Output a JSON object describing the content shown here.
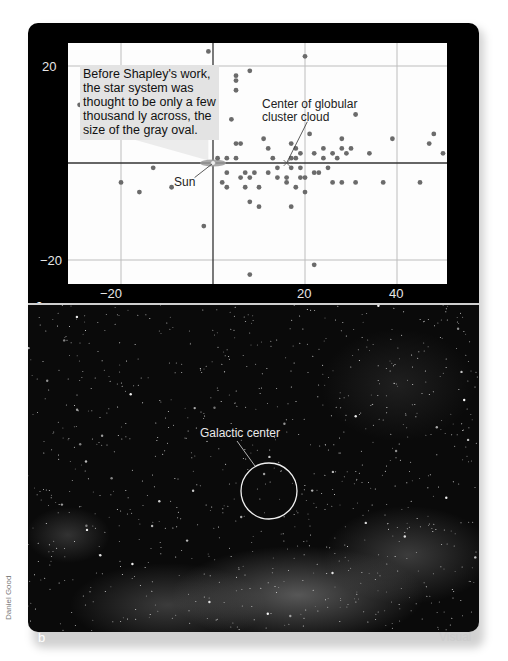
{
  "panel_a": {
    "label": "a",
    "callout_text": "Before Shapley's work, the star system was thought to be only a few thousand ly across, the size of the gray oval.",
    "center_label_line1": "Center of globular",
    "center_label_line2": "cluster cloud",
    "sun_label": "Sun",
    "y_ticks": [
      "20",
      "−20"
    ],
    "x_ticks": [
      "−20",
      "20",
      "40"
    ]
  },
  "panel_b": {
    "label": "b",
    "galactic_center_label": "Galactic center",
    "band_label": "Visual",
    "credit": "Daniel Good"
  },
  "chart_data": {
    "type": "scatter",
    "title": "",
    "xlabel": "",
    "ylabel": "",
    "xlim": [
      -31,
      51
    ],
    "ylim": [
      -25,
      25
    ],
    "x_ticks": [
      -20,
      20,
      40
    ],
    "y_ticks": [
      20,
      -20
    ],
    "grid": true,
    "gridlines_x": [
      -20,
      20,
      40
    ],
    "gridlines_y": [
      20,
      -20
    ],
    "axes_through_origin": true,
    "annotations": [
      {
        "text": "Sun",
        "x": 0,
        "y": 0
      },
      {
        "text": "Center of globular cluster cloud",
        "x": 16,
        "y": 0
      },
      {
        "text": "Before Shapley's work, the star system was thought to be only a few thousand ly across, the size of the gray oval.",
        "x": -20,
        "y": 20
      }
    ],
    "series": [
      {
        "name": "Globular clusters",
        "points": [
          [
            -29,
            12
          ],
          [
            -20,
            -4
          ],
          [
            -16,
            -6
          ],
          [
            -13,
            -1
          ],
          [
            -9,
            -5
          ],
          [
            -2,
            -13
          ],
          [
            -1,
            23
          ],
          [
            1,
            1
          ],
          [
            3,
            1
          ],
          [
            4,
            9
          ],
          [
            5,
            4
          ],
          [
            5,
            1
          ],
          [
            5,
            15
          ],
          [
            5,
            18
          ],
          [
            5,
            17
          ],
          [
            6,
            4
          ],
          [
            6,
            -3
          ],
          [
            7,
            -5
          ],
          [
            8,
            -3
          ],
          [
            8,
            -8
          ],
          [
            8,
            19
          ],
          [
            8,
            -23
          ],
          [
            2,
            -4
          ],
          [
            3,
            -2
          ],
          [
            3,
            -5
          ],
          [
            7,
            -2
          ],
          [
            9,
            -2
          ],
          [
            10,
            -5
          ],
          [
            10,
            -9
          ],
          [
            11,
            5
          ],
          [
            12,
            3
          ],
          [
            12,
            -2
          ],
          [
            13,
            1
          ],
          [
            14,
            -1
          ],
          [
            14,
            -3
          ],
          [
            16,
            -3
          ],
          [
            16,
            -4
          ],
          [
            17,
            1
          ],
          [
            17,
            4
          ],
          [
            17,
            -1
          ],
          [
            17,
            -9
          ],
          [
            18,
            1
          ],
          [
            18,
            3
          ],
          [
            18,
            -5
          ],
          [
            19,
            2
          ],
          [
            19,
            -1
          ],
          [
            19,
            -3
          ],
          [
            20,
            -3
          ],
          [
            20,
            -6
          ],
          [
            20,
            22
          ],
          [
            21,
            6
          ],
          [
            22,
            2
          ],
          [
            22,
            -2
          ],
          [
            22,
            -21
          ],
          [
            23,
            -2
          ],
          [
            24,
            1
          ],
          [
            24,
            3
          ],
          [
            25,
            -1
          ],
          [
            26,
            2
          ],
          [
            26,
            -4
          ],
          [
            27,
            1
          ],
          [
            28,
            5
          ],
          [
            28,
            3
          ],
          [
            28,
            -4
          ],
          [
            29,
            2
          ],
          [
            30,
            3
          ],
          [
            31,
            10
          ],
          [
            31,
            -4
          ],
          [
            34,
            2
          ],
          [
            37,
            -4
          ],
          [
            39,
            5
          ],
          [
            45,
            -4
          ],
          [
            47,
            4
          ],
          [
            48,
            6
          ],
          [
            50,
            2
          ]
        ]
      }
    ]
  }
}
